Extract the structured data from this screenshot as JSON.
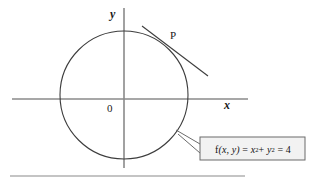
{
  "figure": {
    "axis_labels": {
      "x": "x",
      "y": "y",
      "origin": "0"
    },
    "point_label": "P",
    "callout": {
      "function_name": "f",
      "arguments": "(x, y)",
      "equals": "=",
      "term1_base": "x",
      "term1_exponent": "2",
      "plus": "+",
      "term2_base": "y",
      "term2_exponent": "2",
      "equals2": "=",
      "value": "4",
      "full_text": "f(x, y) = x2 + y2 = 4"
    },
    "colors": {
      "curve": "#3d3d3d",
      "axis": "#8a8a8a",
      "callout_border": "#6b6b6b",
      "callout_fill": "#f2f2f2",
      "text": "#1a1a1a",
      "rule": "#8a8a8a"
    },
    "geometry": {
      "circle_center_x": 124,
      "circle_center_y": 95,
      "circle_radius": 64,
      "tangent_point_x": 168,
      "tangent_point_y": 48,
      "x_axis_y": 99,
      "y_axis_x": 124
    }
  }
}
